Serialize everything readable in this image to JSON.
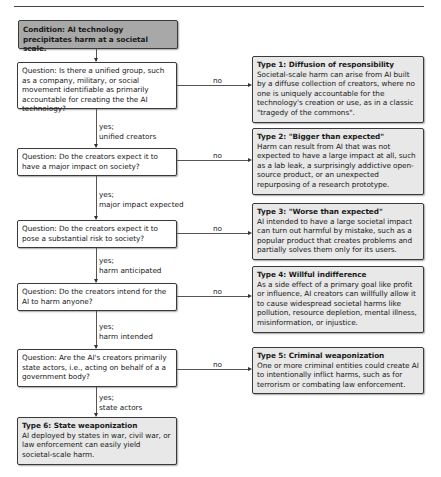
{
  "diagram": {
    "condition": "Condition: AI technology precipitates harm at a societal scale.",
    "questions": [
      {
        "text": "Question: Is there a unified group, such as a company, military, or social movement identifiable as primarily accountable for creating the the AI technology?",
        "yes_label": "yes;",
        "yes_detail": "unified creators",
        "no_label": "no"
      },
      {
        "text": "Question: Do the creators expect it to have a major impact on society?",
        "yes_label": "yes;",
        "yes_detail": "major impact expected",
        "no_label": "no"
      },
      {
        "text": "Question: Do the creators expect it to pose a substantial risk to society?",
        "yes_label": "yes;",
        "yes_detail": "harm anticipated",
        "no_label": "no"
      },
      {
        "text": "Question: Do the creators intend for the AI to harm anyone?",
        "yes_label": "yes;",
        "yes_detail": "harm intended",
        "no_label": "no"
      },
      {
        "text": "Question: Are the AI's creators primarily state actors, i.e., acting on behalf of a a government body?",
        "yes_label": "yes;",
        "yes_detail": "state actors",
        "no_label": "no"
      }
    ],
    "types": [
      {
        "title": "Type 1: Diffusion of responsibility",
        "body": "Societal-scale harm can arise from AI built by a diffuse collection of creators, where no one is uniquely accountable for the technology's creation or use, as in a classic \"tragedy of the commons\"."
      },
      {
        "title": "Type 2: \"Bigger than expected\"",
        "body": "Harm can result from AI that was not expected to have a large impact at all, such as a lab leak, a surprisingly addictive open-source product, or an unexpected repurposing of a research prototype."
      },
      {
        "title": "Type 3: \"Worse than expected\"",
        "body": "AI intended to have a large societal impact can turn out harmful by mistake, such as a popular product that creates problems and partially solves them only for its users."
      },
      {
        "title": "Type 4: Willful indifference",
        "body": "As a side effect of a primary goal like profit or influence, AI creators can willfully allow it to cause widespread societal harms like pollution, resource depletion, mental illness, misinformation, or injustice."
      },
      {
        "title": "Type 5: Criminal weaponization",
        "body": "One or more criminal entities could create AI to intentionally inflict harms, such as for terrorism or combating law enforcement."
      },
      {
        "title": "Type 6: State weaponization",
        "body": "AI deployed by states in war, civil war, or law enforcement can easily yield societal-scale harm."
      }
    ]
  }
}
